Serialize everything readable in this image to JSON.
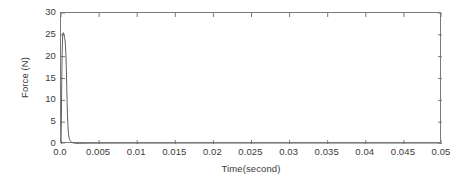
{
  "chart_data": {
    "type": "line",
    "title": "",
    "xlabel": "Time(second)",
    "ylabel": "Force (N)",
    "xlim": [
      0.0,
      0.05
    ],
    "ylim": [
      0,
      30
    ],
    "xticks": [
      0.0,
      0.005,
      0.01,
      0.015,
      0.02,
      0.025,
      0.03,
      0.035,
      0.04,
      0.045,
      0.05
    ],
    "xticklabels": [
      "0.0",
      "0.005",
      "0.01",
      "0.015",
      "0.02",
      "0.025",
      "0.03",
      "0.035",
      "0.04",
      "0.045",
      "0.05"
    ],
    "yticks": [
      0,
      5,
      10,
      15,
      20,
      25,
      30
    ],
    "yticklabels": [
      "0",
      "5",
      "10",
      "15",
      "20",
      "25",
      "30"
    ],
    "grid": false,
    "legend": null,
    "box": true,
    "tick_direction": "in",
    "line_color": "#4d4d4d",
    "line_width": 0.9,
    "axis_color": "#7a7a7a",
    "background_color": "#ffffff",
    "series": [
      {
        "name": "Force",
        "x": [
          0.0,
          5e-05,
          0.0001,
          0.00015,
          0.0002,
          0.00025,
          0.0003,
          0.00035,
          0.0004,
          0.00045,
          0.0005,
          0.00055,
          0.0006,
          0.00065,
          0.0007,
          0.00075,
          0.0008,
          0.00085,
          0.0009,
          0.00095,
          0.001,
          0.00105,
          0.0011,
          0.00115,
          0.0012,
          0.00125,
          0.0013,
          0.00135,
          0.0014,
          0.0015,
          0.0016,
          0.0017,
          0.0018,
          0.0019,
          0.002,
          0.0022,
          0.0024,
          0.0026,
          0.003,
          0.004,
          0.006,
          0.01,
          0.02,
          0.03,
          0.04,
          0.05
        ],
        "y": [
          0.0,
          6.0,
          14.5,
          20.5,
          24.0,
          25.4,
          25.5,
          25.3,
          25.0,
          24.6,
          24.1,
          23.4,
          22.2,
          20.2,
          17.2,
          13.4,
          9.6,
          6.6,
          4.4,
          3.0,
          2.1,
          1.55,
          1.2,
          0.95,
          0.78,
          0.65,
          0.55,
          0.47,
          0.41,
          0.32,
          0.26,
          0.21,
          0.18,
          0.15,
          0.13,
          0.1,
          0.08,
          0.07,
          0.05,
          0.03,
          0.02,
          0.01,
          0.0,
          0.0,
          0.0,
          0.0
        ],
        "annotation": "Impulsive force spike peaking near 25.5 N at t = 0.0003 s, decaying to ~0 N by t = 0.002 s and flat through t = 0.05 s."
      }
    ]
  }
}
